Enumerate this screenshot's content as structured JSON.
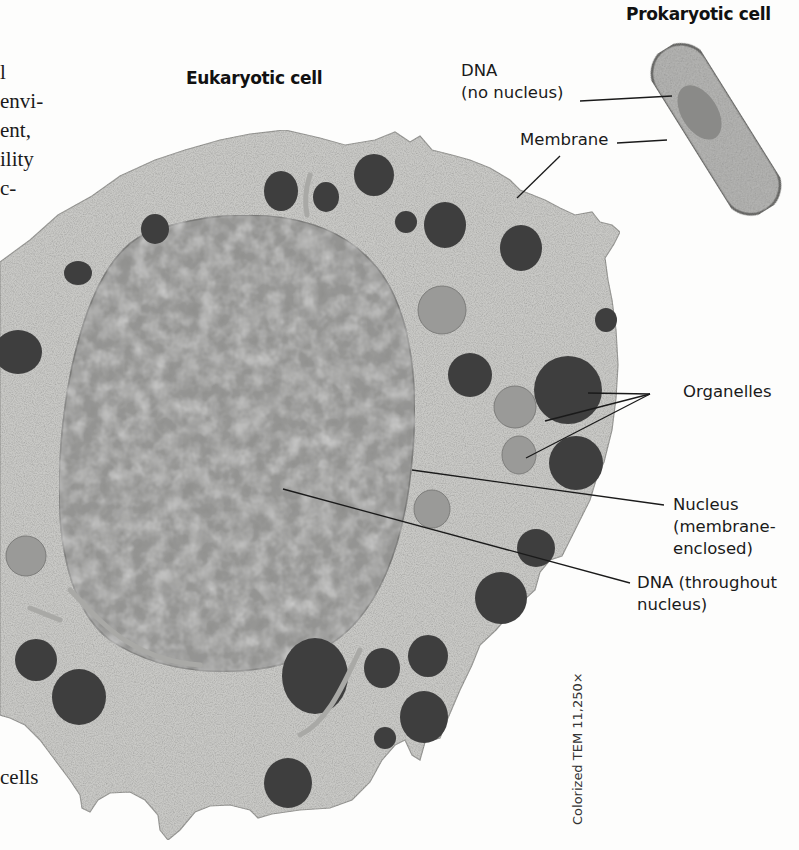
{
  "figure": {
    "titles": {
      "prokaryotic": "Prokaryotic cell",
      "eukaryotic": "Eukaryotic cell"
    },
    "labels": {
      "prok_dna_line1": "DNA",
      "prok_dna_line2": "(no nucleus)",
      "membrane": "Membrane",
      "organelles": "Organelles",
      "nucleus_line1": "Nucleus",
      "nucleus_line2": "(membrane-",
      "nucleus_line3": "enclosed)",
      "euk_dna_line1": "DNA (throughout",
      "euk_dna_line2": "nucleus)"
    },
    "credit": "Colorized TEM 11,250×",
    "colors": {
      "cytoplasm": "#c9c9c6",
      "nucleus": "#8e8e8c",
      "dark_organelle": "#3e3e3e",
      "pale_organelle": "#9a9a98",
      "prokaryote_fill": "#b4b4b2",
      "prokaryote_edge": "#6d6d6b",
      "leader_line": "#1a1a1a"
    }
  },
  "body_text_fragments": [
    "l",
    "envi-",
    "ent,",
    "ility",
    "c-",
    "cells"
  ]
}
